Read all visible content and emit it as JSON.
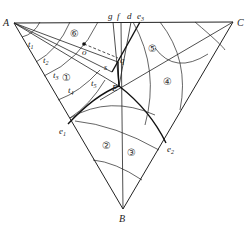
{
  "diagram": {
    "type": "ternary-triangle-slip-line-field",
    "vertices": {
      "A": {
        "label": "A",
        "x": 14,
        "y": 23
      },
      "B": {
        "label": "B",
        "x": 123,
        "y": 209
      },
      "C": {
        "label": "C",
        "x": 233,
        "y": 22
      }
    },
    "points": {
      "E": {
        "label": "E",
        "x": 119,
        "y": 86
      },
      "q": {
        "label": "q",
        "x": 118,
        "y": 62
      },
      "o": {
        "label": "o",
        "x": 84,
        "y": 44
      },
      "s": {
        "label": "s",
        "x": 104,
        "y": 67
      },
      "e1": {
        "label": "e",
        "sub": "1",
        "x": 68,
        "y": 124
      },
      "e2": {
        "label": "e",
        "sub": "2",
        "x": 166,
        "y": 143
      },
      "e3": {
        "label": "e",
        "sub": "3",
        "x": 140,
        "y": 22
      },
      "d": {
        "label": "d",
        "x": 131,
        "y": 22
      },
      "f": {
        "label": "f",
        "x": 121,
        "y": 22
      },
      "g": {
        "label": "g",
        "x": 113,
        "y": 22
      }
    },
    "t_labels": [
      {
        "label": "t",
        "sub": "1",
        "x": 28,
        "y": 47
      },
      {
        "label": "t",
        "sub": "2",
        "x": 43,
        "y": 63
      },
      {
        "label": "t",
        "sub": "3",
        "x": 53,
        "y": 78
      },
      {
        "label": "t",
        "sub": "4",
        "x": 68,
        "y": 93
      },
      {
        "label": "t",
        "sub": "5",
        "x": 91,
        "y": 86
      }
    ],
    "regions": [
      {
        "label": "①",
        "x": 66,
        "y": 77
      },
      {
        "label": "②",
        "x": 107,
        "y": 145
      },
      {
        "label": "③",
        "x": 132,
        "y": 152
      },
      {
        "label": "④",
        "x": 168,
        "y": 81
      },
      {
        "label": "⑤",
        "x": 153,
        "y": 48
      },
      {
        "label": "⑥",
        "x": 75,
        "y": 33
      }
    ]
  }
}
